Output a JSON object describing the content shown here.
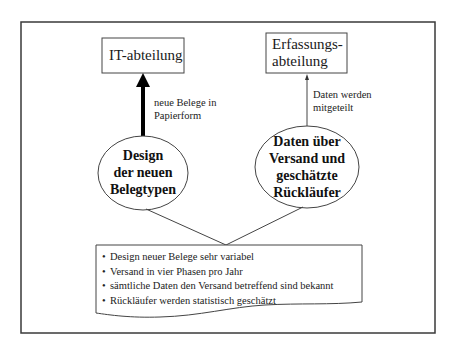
{
  "diagram": {
    "nodes": {
      "it_department": {
        "label": "IT-abteilung"
      },
      "capture_department": {
        "line1": "Erfassungs-",
        "line2": "abteilung"
      },
      "design_ellipse": {
        "line1": "Design",
        "line2": "der neuen",
        "line3": "Belegtypen"
      },
      "data_ellipse": {
        "line1": "Daten über",
        "line2": "Versand und",
        "line3": "geschätzte",
        "line4": "Rückläufer"
      }
    },
    "edges": {
      "design_to_it": {
        "line1": "neue Belege in",
        "line2": "Papierform",
        "style": "thick arrow"
      },
      "data_to_capture": {
        "line1": "Daten werden",
        "line2": "mitgeteilt",
        "style": "thin arrow"
      }
    },
    "note": {
      "bullet_glyph": "•",
      "items": [
        "Design neuer Belege sehr variabel",
        "Versand in vier Phasen pro Jahr",
        "sämtliche Daten den Versand betreffend sind bekannt",
        "Rückläufer werden statistisch geschätzt"
      ]
    },
    "colors": {
      "stroke": "#333333",
      "background": "#ffffff",
      "text": "#1a1a1a"
    }
  }
}
